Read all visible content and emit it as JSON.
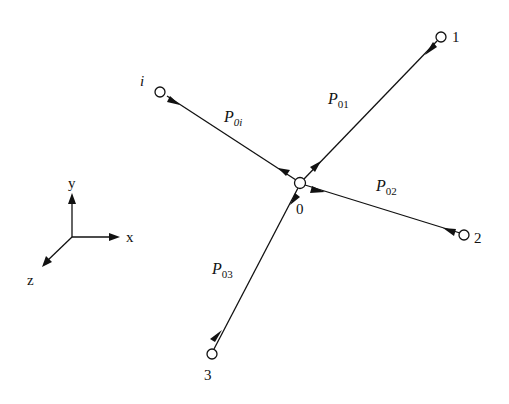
{
  "diagram": {
    "nodes": [
      {
        "id": "0",
        "label": "0",
        "x": 300,
        "y": 183
      },
      {
        "id": "1",
        "label": "1",
        "x": 441,
        "y": 37
      },
      {
        "id": "2",
        "label": "2",
        "x": 465,
        "y": 234
      },
      {
        "id": "3",
        "label": "3",
        "x": 212,
        "y": 354
      },
      {
        "id": "i",
        "label": "i",
        "x": 162,
        "y": 93
      }
    ],
    "edges": [
      {
        "from": "0",
        "to": "1",
        "label_main": "P",
        "label_sub": "01"
      },
      {
        "from": "0",
        "to": "2",
        "label_main": "P",
        "label_sub": "02"
      },
      {
        "from": "0",
        "to": "3",
        "label_main": "P",
        "label_sub": "03"
      },
      {
        "from": "0",
        "to": "i",
        "label_main": "P",
        "label_sub": "0i"
      }
    ],
    "axes": {
      "x_label": "x",
      "y_label": "y",
      "z_label": "z"
    }
  }
}
